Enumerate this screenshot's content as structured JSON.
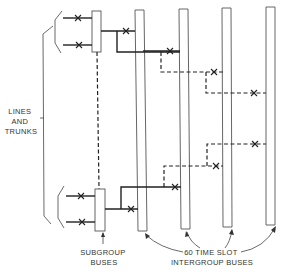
{
  "diagram": {
    "labels": {
      "lines_and_trunks": [
        "LINES",
        "AND",
        "TRUNKS"
      ],
      "subgroup_buses": [
        "SUBGROUP",
        "BUSES"
      ],
      "intergroup_buses": [
        "60 TIME SLOT",
        "INTERGROUP BUSES"
      ]
    },
    "subgroup_bus_count": 2,
    "intergroup_bus_count": 4,
    "line_color": "#222222",
    "bus_outline_color": "#555555"
  }
}
